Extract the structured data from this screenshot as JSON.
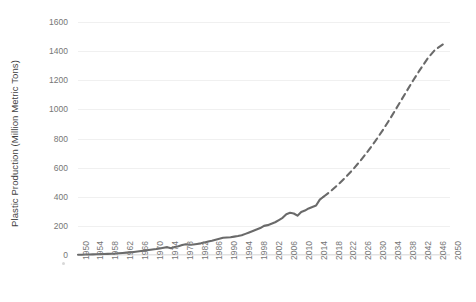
{
  "chart_data": {
    "type": "line",
    "title": "",
    "xlabel": "",
    "ylabel": "Plastic Production (Million Metric Tons)",
    "ylim": [
      0,
      1600
    ],
    "xlim": [
      1950,
      2050
    ],
    "ytick_labels": [
      "1600",
      "1400",
      "1200",
      "1000",
      "800",
      "600",
      "400",
      "200",
      "0"
    ],
    "ytick_values": [
      1600,
      1400,
      1200,
      1000,
      800,
      600,
      400,
      200,
      0
    ],
    "xtick_labels": [
      "1950",
      "1954",
      "1958",
      "1962",
      "1966",
      "1970",
      "1974",
      "1978",
      "1982",
      "1986",
      "1990",
      "1994",
      "1998",
      "2002",
      "2006",
      "2010",
      "2014",
      "2018",
      "2022",
      "2026",
      "2030",
      "2034",
      "2038",
      "2042",
      "2046",
      "2050"
    ],
    "xtick_values": [
      1950,
      1954,
      1958,
      1962,
      1966,
      1970,
      1974,
      1978,
      1982,
      1986,
      1990,
      1994,
      1998,
      2002,
      2006,
      2010,
      2014,
      2018,
      2022,
      2026,
      2030,
      2034,
      2038,
      2042,
      2046,
      2050
    ],
    "grid": true,
    "legend": null,
    "legend_position": "none",
    "line_color": "#6a6a6a",
    "series": [
      {
        "name": "Historical plastic production",
        "style": "solid",
        "x": [
          1950,
          1951,
          1952,
          1953,
          1954,
          1955,
          1956,
          1957,
          1958,
          1959,
          1960,
          1961,
          1962,
          1963,
          1964,
          1965,
          1966,
          1967,
          1968,
          1969,
          1970,
          1971,
          1972,
          1973,
          1974,
          1975,
          1976,
          1977,
          1978,
          1979,
          1980,
          1981,
          1982,
          1983,
          1984,
          1985,
          1986,
          1987,
          1988,
          1989,
          1990,
          1991,
          1992,
          1993,
          1994,
          1995,
          1996,
          1997,
          1998,
          1999,
          2000,
          2001,
          2002,
          2003,
          2004,
          2005,
          2006,
          2007,
          2008,
          2009,
          2010,
          2011,
          2012,
          2013,
          2014,
          2015,
          2016
        ],
        "y": [
          2,
          2,
          3,
          3,
          4,
          5,
          6,
          7,
          8,
          9,
          10,
          12,
          14,
          16,
          18,
          21,
          24,
          27,
          30,
          34,
          38,
          41,
          45,
          50,
          54,
          47,
          55,
          60,
          68,
          74,
          70,
          72,
          76,
          80,
          86,
          92,
          98,
          105,
          112,
          118,
          120,
          122,
          126,
          130,
          135,
          145,
          155,
          165,
          175,
          185,
          200,
          205,
          215,
          225,
          240,
          255,
          280,
          290,
          285,
          270,
          295,
          305,
          320,
          330,
          340,
          380,
          400
        ]
      },
      {
        "name": "Projected plastic production",
        "style": "dashed",
        "x": [
          2016,
          2018,
          2020,
          2022,
          2024,
          2026,
          2028,
          2030,
          2032,
          2034,
          2036,
          2038,
          2040,
          2042,
          2044,
          2046,
          2048,
          2049
        ],
        "y": [
          400,
          440,
          485,
          535,
          590,
          650,
          715,
          785,
          860,
          940,
          1025,
          1110,
          1195,
          1275,
          1350,
          1410,
          1445,
          1455
        ]
      }
    ],
    "annotations": []
  }
}
